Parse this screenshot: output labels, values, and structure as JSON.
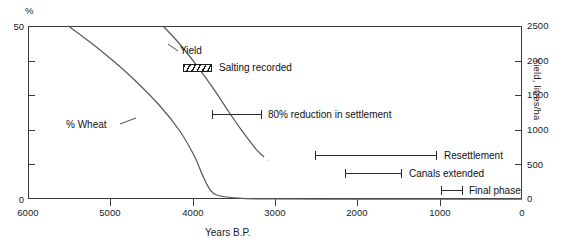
{
  "chart_data": {
    "type": "line",
    "title": "",
    "xlabel": "Years B.P.",
    "ylabel_left": "%",
    "ylabel_right": "Yield, litres/ha",
    "xlim": [
      6000,
      0
    ],
    "xticks": [
      6000,
      5000,
      4000,
      3000,
      2000,
      1000,
      0
    ],
    "xtick_labels": [
      "6000",
      "5000",
      "4000",
      "3000",
      "2000",
      "1000",
      "0"
    ],
    "ylim_left": [
      0,
      50
    ],
    "yticks_left": [
      0,
      10,
      20,
      30,
      40,
      50
    ],
    "ytick_labels_left": [
      "0",
      "50"
    ],
    "ylim_right": [
      0,
      2500
    ],
    "yticks_right": [
      0,
      500,
      1000,
      1500,
      2000,
      2500
    ],
    "ytick_labels_right": [
      "0",
      "500",
      "1000",
      "1500",
      "2000",
      "2500"
    ],
    "grid": false,
    "legend_position": "inline-annotations",
    "series": [
      {
        "name": "% Wheat",
        "axis": "left",
        "label": "% Wheat",
        "style": "solid",
        "x": [
          5510,
          5200,
          4800,
          4400,
          4150,
          3980,
          3880,
          3800,
          3700,
          3400,
          3000,
          2000,
          1000,
          0
        ],
        "y": [
          50,
          44.5,
          36.5,
          27.0,
          19.5,
          12.5,
          7.0,
          3.2,
          1.2,
          0.3,
          0.15,
          0.1,
          0.1,
          0.1
        ]
      },
      {
        "name": "Yield",
        "axis": "right",
        "label": "Yield",
        "style": "solid-with-break",
        "x": [
          4360,
          4150,
          3950,
          3750,
          3560,
          3420,
          3300,
          3230,
          3160,
          3080
        ],
        "y": [
          2500,
          2230,
          1930,
          1600,
          1260,
          1020,
          830,
          720,
          640,
          560
        ],
        "break_after_x": 3230
      }
    ],
    "annotations": [
      {
        "name": "salting-recorded",
        "label": "Salting recorded",
        "marker": "hatched-rectangle",
        "marker_x_range": [
          3830,
          3590
        ],
        "y_level_pct": 36
      },
      {
        "name": "80-percent-reduction",
        "label": "80% reduction in settlement",
        "marker": "range-bar",
        "x_range": [
          3770,
          3160
        ]
      },
      {
        "name": "resettlement",
        "label": "Resettlement",
        "marker": "range-bar",
        "x_range": [
          2580,
          1100
        ]
      },
      {
        "name": "canals-extended",
        "label": "Canals extended",
        "marker": "range-bar",
        "x_range": [
          2180,
          1430
        ]
      },
      {
        "name": "final-phase",
        "label": "Final phase",
        "marker": "range-bar",
        "x_range": [
          1180,
          1030
        ]
      }
    ]
  },
  "axes": {
    "left": {
      "unit_label": "%",
      "top_label": "50",
      "bottom_label": "0"
    },
    "right": {
      "title": "Yield, litres/ha",
      "labels": [
        "2500",
        "2000",
        "1500",
        "1000",
        "500",
        "0"
      ]
    },
    "bottom": {
      "title": "Years B.P.",
      "labels": [
        "6000",
        "5000",
        "4000",
        "3000",
        "2000",
        "1000",
        "0"
      ]
    }
  },
  "curve_labels": {
    "yield": "Yield",
    "wheat": "% Wheat"
  },
  "annotation_labels": {
    "salting": "Salting recorded",
    "reduction": "80% reduction in settlement",
    "resettlement": "Resettlement",
    "canals": "Canals extended",
    "final": "Final phase"
  },
  "colors": {
    "ink": "#1a1a1a",
    "axis": "#3a3a3a",
    "curve": "#555555",
    "background": "#ffffff"
  }
}
